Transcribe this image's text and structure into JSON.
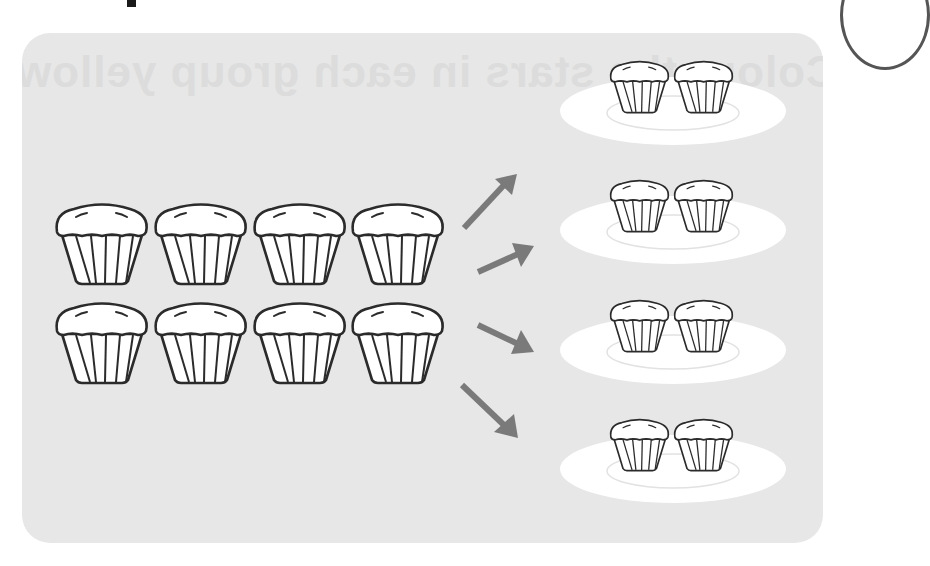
{
  "page": {
    "heading_fragment": "p",
    "ghost_text": "Colour the stars in each group yellow"
  },
  "diagram": {
    "source_group": {
      "label": "8 muffins",
      "rows": 2,
      "columns": 4,
      "count": 8
    },
    "arrows": {
      "count": 4,
      "color": "#7a7a7a"
    },
    "plates": [
      {
        "label": "plate 1",
        "muffins": 2
      },
      {
        "label": "plate 2",
        "muffins": 2
      },
      {
        "label": "plate 3",
        "muffins": 2
      },
      {
        "label": "plate 4",
        "muffins": 2
      }
    ],
    "colors": {
      "panel": "#e7e7e7",
      "plate": "#ffffff",
      "plate_ring": "#e2e2e2",
      "outline": "#2b2b2b",
      "arrow": "#7a7a7a"
    }
  }
}
